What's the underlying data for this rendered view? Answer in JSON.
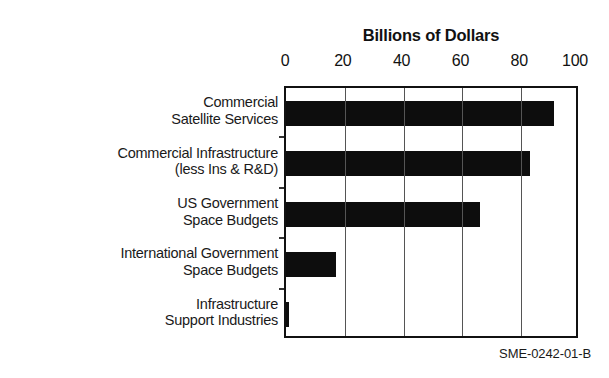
{
  "chart_data": {
    "type": "bar",
    "orientation": "horizontal",
    "title": "Billions of Dollars",
    "xlabel": "",
    "ylabel": "",
    "xlim": [
      0,
      100
    ],
    "xticks": [
      0,
      20,
      40,
      60,
      80,
      100
    ],
    "xtick_labels": [
      "0",
      "20",
      "40",
      "60",
      "80",
      "100"
    ],
    "grid": true,
    "grid_axis": "x",
    "legend": false,
    "bar_color": "#0d0d0d",
    "axis_color": "#111111",
    "categories": [
      "Commercial Satellite Services",
      "Commercial Infrastructure (less Ins & R&D)",
      "US Government Space Budgets",
      "International Government Space Budgets",
      "Infrastructure Support Industries"
    ],
    "category_lines": [
      [
        "Commercial",
        "Satellite Services"
      ],
      [
        "Commercial Infrastructure",
        "(less Ins & R&D)"
      ],
      [
        "US Government",
        "Space Budgets"
      ],
      [
        "International Government",
        "Space Budgets"
      ],
      [
        "Infrastructure",
        "Support Industries"
      ]
    ],
    "values": [
      91,
      83,
      66,
      17,
      1
    ]
  },
  "footer": {
    "code": "SME-0242-01-B"
  }
}
